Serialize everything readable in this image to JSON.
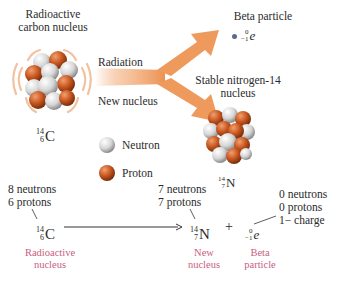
{
  "top": {
    "radioactive_label_line1": "Radioactive",
    "radioactive_label_line2": "carbon nucleus",
    "arrow_upper_label": "Radiation",
    "arrow_lower_label": "New nucleus",
    "beta_title": "Beta particle",
    "beta_symbol": {
      "mass": "0",
      "charge": "−1",
      "symbol": "e"
    },
    "stable_label_line1": "Stable nitrogen-14",
    "stable_label_line2": "nucleus",
    "carbon_symbol": {
      "mass": "14",
      "atomic": "6",
      "symbol": "C"
    },
    "nitrogen_symbol": {
      "mass": "14",
      "atomic": "7",
      "symbol": "N"
    }
  },
  "legend": {
    "items": [
      {
        "label": "Neutron",
        "color": "#d8d8d8"
      },
      {
        "label": "Proton",
        "color": "#c0531f"
      }
    ]
  },
  "equation": {
    "reactant": {
      "annotation_line1": "8 neutrons",
      "annotation_line2": "6 protons",
      "mass": "14",
      "atomic": "6",
      "symbol": "C",
      "caption_line1": "Radioactive",
      "caption_line2": "nucleus"
    },
    "product1": {
      "annotation_line1": "7 neutrons",
      "annotation_line2": "7 protons",
      "mass": "14",
      "atomic": "7",
      "symbol": "N",
      "caption_line1": "New",
      "caption_line2": "nucleus"
    },
    "plus": "+",
    "product2": {
      "annotation_line1": "0 neutrons",
      "annotation_line2": "0 protons",
      "annotation_line3": "1− charge",
      "mass": "0",
      "atomic": "−1",
      "symbol": "e",
      "caption_line1": "Beta",
      "caption_line2": "particle"
    }
  },
  "colors": {
    "arrow": "#ee9a5c",
    "proton": "#c0531f",
    "neutron": "#dcdcdc",
    "caption": "#c9607f",
    "text": "#2b2b2b"
  }
}
